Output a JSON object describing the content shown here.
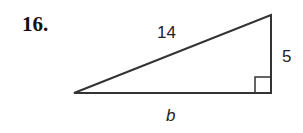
{
  "problem": {
    "number": "16.",
    "hypotenuse_label": "14",
    "vertical_leg_label": "5",
    "base_label": "b"
  },
  "colors": {
    "stroke": "#333333",
    "text": "#222222"
  }
}
